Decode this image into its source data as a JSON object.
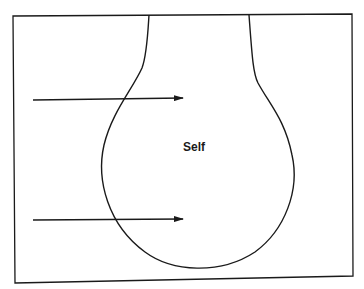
{
  "diagram": {
    "center_label": "Self",
    "shape": "bulb-outline",
    "arrows": [
      {
        "name": "upper-arrow",
        "direction": "right"
      },
      {
        "name": "lower-arrow",
        "direction": "right"
      }
    ],
    "colors": {
      "stroke": "#1a1a1a",
      "background": "#ffffff"
    }
  }
}
